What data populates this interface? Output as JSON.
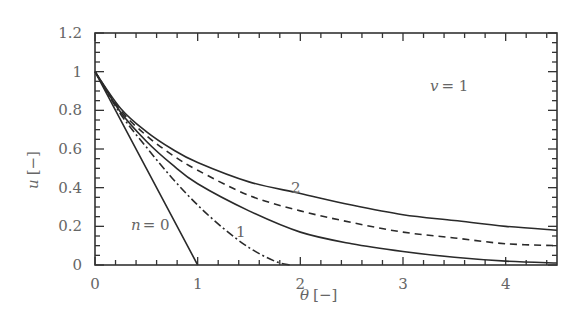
{
  "chart_data": {
    "type": "line",
    "title": "",
    "xlabel": "θ [−]",
    "ylabel": "u [−]",
    "xlim": [
      0,
      4.5
    ],
    "ylim": [
      0,
      1.2
    ],
    "x_ticks": [
      "0",
      "1",
      "2",
      "3",
      "4"
    ],
    "y_ticks": [
      "0",
      "0.2",
      "0.4",
      "0.6",
      "0.8",
      "1",
      "1.2"
    ],
    "grid": false,
    "legend": "none (curves labeled inline)",
    "annotations": [
      "v = 1",
      "n = 0",
      "1",
      "2"
    ],
    "series": [
      {
        "name": "n=0",
        "style": "solid",
        "x": [
          0,
          0.5,
          1.0
        ],
        "values": [
          1.0,
          0.5,
          0.0
        ]
      },
      {
        "name": "n=0.5",
        "style": "dash-dot",
        "x": [
          0,
          0.25,
          0.5,
          0.75,
          1.0,
          1.25,
          1.5,
          1.75,
          1.9
        ],
        "values": [
          1.0,
          0.78,
          0.61,
          0.45,
          0.31,
          0.19,
          0.09,
          0.02,
          0.0
        ]
      },
      {
        "name": "n=1",
        "style": "solid",
        "x": [
          0,
          0.25,
          0.5,
          0.75,
          1.0,
          1.5,
          2.0,
          2.5,
          3.0,
          3.5,
          4.0,
          4.5
        ],
        "values": [
          1.0,
          0.79,
          0.64,
          0.52,
          0.42,
          0.28,
          0.17,
          0.11,
          0.07,
          0.04,
          0.02,
          0.01
        ]
      },
      {
        "name": "n=1.5",
        "style": "dashed",
        "x": [
          0,
          0.25,
          0.5,
          0.75,
          1.0,
          1.5,
          2.0,
          2.5,
          3.0,
          3.5,
          4.0,
          4.5
        ],
        "values": [
          1.0,
          0.8,
          0.67,
          0.57,
          0.49,
          0.36,
          0.28,
          0.22,
          0.17,
          0.14,
          0.11,
          0.1
        ]
      },
      {
        "name": "n=2",
        "style": "solid",
        "x": [
          0,
          0.25,
          0.5,
          0.75,
          1.0,
          1.5,
          2.0,
          2.5,
          3.0,
          3.5,
          4.0,
          4.5
        ],
        "values": [
          1.0,
          0.81,
          0.69,
          0.6,
          0.53,
          0.43,
          0.37,
          0.31,
          0.26,
          0.23,
          0.2,
          0.18
        ]
      }
    ]
  },
  "labels": {
    "xlabel_theta": "θ",
    "xlabel_unit": "[−]",
    "ylabel_u": "u",
    "ylabel_unit": "[−]",
    "v_label": "v",
    "v_value": "= 1",
    "n_label": "n",
    "n_value": "= 0",
    "curve1": "1",
    "curve2": "2"
  }
}
